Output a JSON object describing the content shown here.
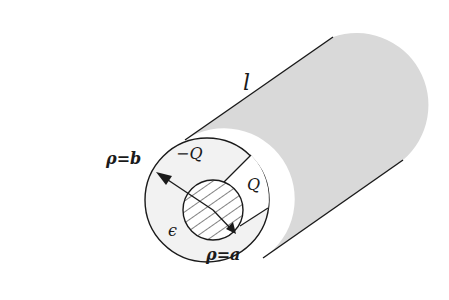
{
  "diagram": {
    "labels": {
      "length": "l",
      "outer_radius": "ρ=b",
      "inner_radius": "ρ=a",
      "outer_charge": "−Q",
      "inner_charge": "Q",
      "permittivity": "ϵ"
    },
    "colors": {
      "body_fill": "#d9d9d9",
      "face_fill": "#f2f2f2",
      "stroke": "#1a1a1a",
      "background": "#ffffff"
    }
  }
}
